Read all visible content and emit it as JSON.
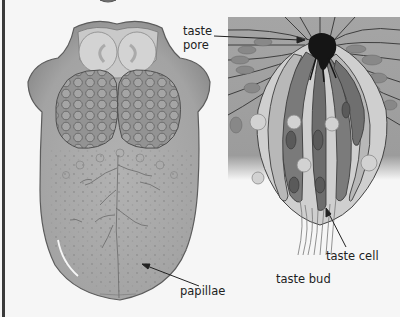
{
  "figure": {
    "panels": [
      {
        "id": "tongue",
        "description": "Dorsal view of the human tongue"
      },
      {
        "id": "taste-bud",
        "description": "Cross-section of a taste bud"
      }
    ]
  },
  "labels": {
    "taste_pore_line1": "taste",
    "taste_pore_line2": "pore",
    "taste_cell": "taste cell",
    "taste_bud": "taste bud",
    "papillae": "papillae"
  },
  "colors": {
    "background": "#f6f6f6",
    "border": "#3a3a3a",
    "tongue_fill": "#a9a9a9",
    "tongue_outline": "#5c5c5c",
    "tonsil_fill": "#8f8f8f",
    "epiglottis_fill": "#cfcfcf",
    "bud_outer": "#a0a0a0",
    "cell_light": "#d6d6d6",
    "cell_dark": "#6f6f6f",
    "pore": "#151515",
    "label_text": "#222222"
  }
}
